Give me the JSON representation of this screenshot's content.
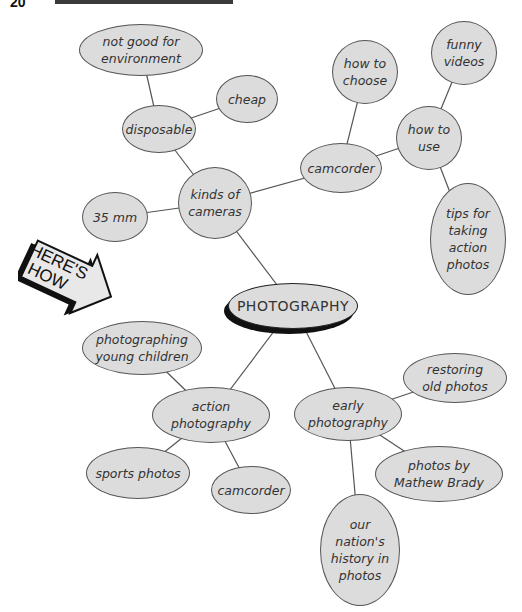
{
  "page": {
    "number_partial": "20",
    "header_bar_color": "#3a3a3a"
  },
  "badge": {
    "line1": "HERE'S",
    "line2": "HOW"
  },
  "diagram": {
    "type": "cluster-map",
    "root": "PHOTOGRAPHY",
    "nodes": {
      "root": {
        "label": "PHOTOGRAPHY",
        "x": 228,
        "y": 283,
        "w": 130,
        "h": 46
      },
      "kinds": {
        "label": "kinds of\ncameras",
        "x": 178,
        "y": 167,
        "w": 74,
        "h": 72
      },
      "disposable": {
        "label": "disposable",
        "x": 122,
        "y": 105,
        "w": 74,
        "h": 48
      },
      "notgood": {
        "label": "not good for\nenvironment",
        "x": 79,
        "y": 24,
        "w": 124,
        "h": 52
      },
      "cheap": {
        "label": "cheap",
        "x": 216,
        "y": 75,
        "w": 62,
        "h": 48
      },
      "mm35": {
        "label": "35 mm",
        "x": 82,
        "y": 192,
        "w": 66,
        "h": 50
      },
      "camcorder": {
        "label": "camcorder",
        "x": 300,
        "y": 143,
        "w": 82,
        "h": 50
      },
      "howchoose": {
        "label": "how to\nchoose",
        "x": 332,
        "y": 40,
        "w": 66,
        "h": 64
      },
      "howuse": {
        "label": "how to\nuse",
        "x": 396,
        "y": 106,
        "w": 66,
        "h": 64
      },
      "funny": {
        "label": "funny\nvideos",
        "x": 431,
        "y": 21,
        "w": 66,
        "h": 64
      },
      "tips": {
        "label": "tips for\ntaking\naction\nphotos",
        "x": 430,
        "y": 183,
        "w": 76,
        "h": 112
      },
      "youngchildren": {
        "label": "photographing\nyoung children",
        "x": 82,
        "y": 321,
        "w": 120,
        "h": 54
      },
      "action": {
        "label": "action\nphotography",
        "x": 152,
        "y": 387,
        "w": 118,
        "h": 56
      },
      "sports": {
        "label": "sports photos",
        "x": 86,
        "y": 447,
        "w": 104,
        "h": 52
      },
      "camcorder2": {
        "label": "camcorder",
        "x": 211,
        "y": 466,
        "w": 80,
        "h": 48
      },
      "early": {
        "label": "early\nphotography",
        "x": 294,
        "y": 387,
        "w": 108,
        "h": 54
      },
      "restoring": {
        "label": "restoring\nold photos",
        "x": 403,
        "y": 353,
        "w": 104,
        "h": 50
      },
      "brady": {
        "label": "photos by\nMathew Brady",
        "x": 375,
        "y": 446,
        "w": 128,
        "h": 56
      },
      "nation": {
        "label": "our\nnation's\nhistory in\nphotos",
        "x": 320,
        "y": 494,
        "w": 80,
        "h": 112
      }
    },
    "edges": [
      [
        "root",
        "kinds"
      ],
      [
        "kinds",
        "disposable"
      ],
      [
        "disposable",
        "notgood"
      ],
      [
        "disposable",
        "cheap"
      ],
      [
        "kinds",
        "mm35"
      ],
      [
        "kinds",
        "camcorder"
      ],
      [
        "camcorder",
        "howchoose"
      ],
      [
        "camcorder",
        "howuse"
      ],
      [
        "howuse",
        "funny"
      ],
      [
        "howuse",
        "tips"
      ],
      [
        "root",
        "action"
      ],
      [
        "action",
        "youngchildren"
      ],
      [
        "action",
        "sports"
      ],
      [
        "action",
        "camcorder2"
      ],
      [
        "root",
        "early"
      ],
      [
        "early",
        "restoring"
      ],
      [
        "early",
        "brady"
      ],
      [
        "early",
        "nation"
      ]
    ],
    "colors": {
      "node_fill": "#dcdcdc",
      "node_stroke": "#555555",
      "edge": "#555555",
      "text": "#333333"
    }
  }
}
